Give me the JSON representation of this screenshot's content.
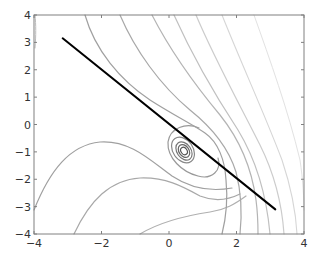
{
  "chart_data": {
    "type": "contour",
    "title": "",
    "xlabel": "",
    "ylabel": "",
    "xlim": [
      -4,
      4
    ],
    "ylim": [
      -4,
      4
    ],
    "grid": false,
    "legend": null,
    "x_ticks": [
      -4,
      -2,
      0,
      2,
      4
    ],
    "y_ticks": [
      -4,
      -3,
      -2,
      -1,
      0,
      1,
      2,
      3,
      4
    ],
    "x_tick_labels": [
      "−4",
      "−2",
      "0",
      "2",
      "4"
    ],
    "y_tick_labels": [
      "−4",
      "−3",
      "−2",
      "−1",
      "0",
      "1",
      "2",
      "3",
      "4"
    ],
    "series": [
      {
        "name": "line",
        "type": "line",
        "color": "#000000",
        "x": [
          -3.15,
          3.15
        ],
        "y": [
          3.15,
          -3.1
        ]
      },
      {
        "name": "contours",
        "type": "contour",
        "color_range": [
          "#555555",
          "#e0e0e0"
        ],
        "minimum": {
          "x": 0.45,
          "y": -0.95
        },
        "levels_visible": 14
      }
    ]
  },
  "colors": {
    "axes": "#808080",
    "line": "#000000",
    "contour_dark": "#555555",
    "contour_light": "#dddddd"
  }
}
